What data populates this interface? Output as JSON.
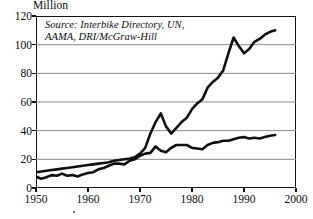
{
  "figure": {
    "unit_label": "Million",
    "source_note": "Source: Interbike Directory, UN,\nAAMA, DRI/McGraw-Hill",
    "line_color": "#101010",
    "grid_color": "#8d8d8d",
    "frame_color": "#141414"
  },
  "chart_data": {
    "type": "line",
    "title": "",
    "subtitle": "",
    "xlabel": "",
    "ylabel": "Million",
    "annotations": [
      "Source: Interbike Directory, UN, AAMA, DRI/McGraw-Hill"
    ],
    "grid": true,
    "legend_position": "none",
    "xlim": [
      1950,
      2000
    ],
    "ylim": [
      0,
      120
    ],
    "xticks": [
      1950,
      1960,
      1970,
      1980,
      1990,
      2000
    ],
    "xtick_labels": [
      "1950",
      "1960",
      "1970",
      "1980",
      "1990",
      "2000"
    ],
    "yticks": [
      0,
      20,
      40,
      60,
      80,
      100,
      120
    ],
    "ytick_labels": [
      "0",
      "20",
      "40",
      "60",
      "80",
      "100",
      "120"
    ],
    "x": [
      1950,
      1951,
      1952,
      1953,
      1954,
      1955,
      1956,
      1957,
      1958,
      1959,
      1960,
      1961,
      1962,
      1963,
      1964,
      1965,
      1966,
      1967,
      1968,
      1969,
      1970,
      1971,
      1972,
      1973,
      1974,
      1975,
      1976,
      1977,
      1978,
      1979,
      1980,
      1981,
      1982,
      1983,
      1984,
      1985,
      1986,
      1987,
      1988,
      1989,
      1990,
      1991,
      1992,
      1993,
      1994,
      1995,
      1996
    ],
    "series": [
      {
        "name": "Bicycle production",
        "values": [
          11,
          11.5,
          12,
          12.5,
          13,
          13.5,
          14,
          14.5,
          15,
          15.5,
          16,
          16.5,
          17,
          17.5,
          18,
          19,
          19.5,
          20,
          20.5,
          21.5,
          24,
          28,
          38,
          46,
          52,
          43,
          38,
          42,
          46,
          49,
          55,
          59,
          62,
          70,
          74,
          77,
          82,
          94,
          105,
          99,
          94,
          97,
          102,
          104,
          107,
          109,
          110
        ]
      },
      {
        "name": "Automobile production",
        "values": [
          8,
          6.5,
          7.5,
          9,
          8.5,
          10,
          8.5,
          9,
          8,
          9.5,
          10.5,
          11,
          13,
          14,
          15.5,
          17,
          17,
          16.5,
          19,
          20,
          22.5,
          24,
          24.5,
          29,
          26,
          25,
          28,
          30,
          30,
          30,
          28,
          27.5,
          27,
          30,
          31.5,
          32,
          33,
          33,
          34,
          35,
          35.5,
          34.5,
          35,
          34.5,
          35.5,
          36.5,
          37
        ]
      }
    ]
  }
}
